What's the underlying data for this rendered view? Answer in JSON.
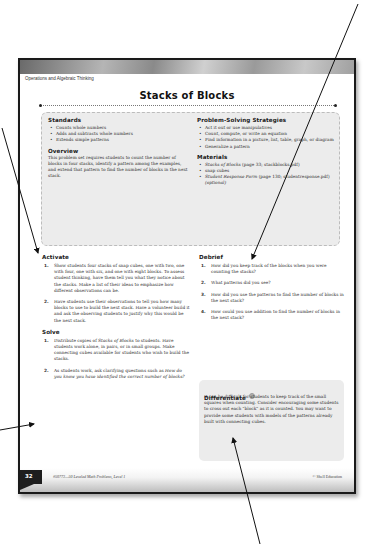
{
  "header": {
    "category": "Operations and Algebraic Thinking",
    "title": "Stacks of Blocks"
  },
  "standards": {
    "heading": "Standards",
    "items": [
      "Counts whole numbers",
      "Adds and subtracts whole numbers",
      "Extends simple patterns"
    ]
  },
  "overview": {
    "heading": "Overview",
    "text": "This problem set requires students to count the number of blocks in four stacks, identify a pattern among the examples, and extend that pattern to find the number of blocks in the next stack."
  },
  "strategies": {
    "heading": "Problem-Solving Strategies",
    "items": [
      "Act it out or use manipulatives",
      "Count, compute, or write an equation",
      "Find information in a picture, list, table, graph, or diagram",
      "Generalize a pattern"
    ]
  },
  "materials": {
    "heading": "Materials",
    "items": [
      {
        "italic": "Stacks of Blocks",
        "rest": " (page 33; stackblocks.pdf)"
      },
      {
        "italic": "",
        "rest": "snap cubes"
      },
      {
        "italic": "Student Response Form",
        "rest": " (page 130; studentresponse.pdf) ",
        "optional": "(optional)"
      }
    ]
  },
  "activate": {
    "heading": "Activate",
    "items": [
      {
        "num": "1.",
        "text": "Show students four stacks of snap cubes, one with two, one with four, one with six, and one with eight blocks. To assess student thinking, have them tell you what they notice about the stacks. Make a list of their ideas to emphasize how different observations can be."
      },
      {
        "num": "2.",
        "text": "Have students use their observations to tell you how many blocks to use to build the next stack. Have a volunteer build it and ask the observing students to justify why this would be the next stack."
      }
    ]
  },
  "solve": {
    "heading": "Solve",
    "items": [
      {
        "num": "1.",
        "pre": "Distribute copies of ",
        "italic": "Stacks of Blocks",
        "post": " to students. Have students work alone, in pairs, or in small groups. Make connecting cubes available for students who wish to build the stacks."
      },
      {
        "num": "2.",
        "pre": "As students work, ask clarifying questions such as ",
        "italic": "How do you know you have identified the correct number of blocks?",
        "post": ""
      }
    ]
  },
  "debrief": {
    "heading": "Debrief",
    "items": [
      {
        "num": "1.",
        "text": "How did you keep track of the blocks when you were counting the stacks?"
      },
      {
        "num": "2.",
        "text": "What patterns did you see?"
      },
      {
        "num": "3.",
        "text": "How did you use the patterns to find the number of blocks in the next stack?"
      },
      {
        "num": "4.",
        "text": "How could you use addition to find the number of blocks in the next stack?"
      }
    ]
  },
  "differentiate": {
    "heading": "Differentiate",
    "icon": "circle-badge-icon",
    "text": "It can be difficult for students to keep track of the small squares when counting. Consider encouraging some students to cross out each \"block\" as it is counted. You may want to provide some students with models of the patterns already built with connecting cubes."
  },
  "footer": {
    "page_number": "32",
    "book": "#50773—50 Leveled Math Problems, Level 1",
    "copyright": "© Shell Education"
  }
}
